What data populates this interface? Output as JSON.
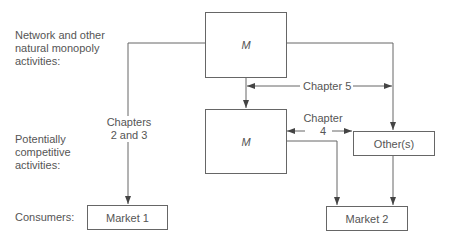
{
  "rows": {
    "network": "Network and other natural monopoly activities:",
    "competitive": "Potentially competitive activities:",
    "consumers": "Consumers:"
  },
  "boxes": {
    "top_m": "M",
    "lower_m": "M",
    "others": "Other(s)",
    "market1": "Market 1",
    "market2": "Market 2"
  },
  "annotations": {
    "ch23_line1": "Chapters",
    "ch23_line2": "2 and 3",
    "ch5": "Chapter 5",
    "ch4_line1": "Chapter",
    "ch4_line2": "4"
  }
}
